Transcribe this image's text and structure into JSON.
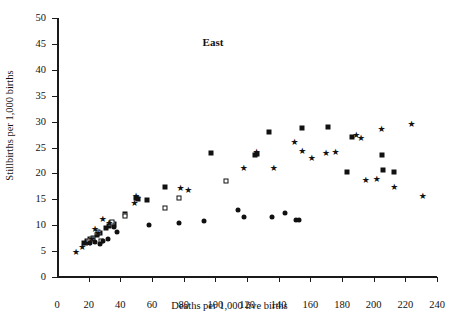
{
  "chart_data": {
    "type": "scatter",
    "title": "East",
    "xlabel": "Deaths per 1,000 live births",
    "ylabel": "Stillbirths per 1,000 births",
    "xlim": [
      0,
      240
    ],
    "ylim": [
      0,
      50
    ],
    "xticks": [
      0,
      20,
      40,
      60,
      80,
      100,
      120,
      140,
      160,
      180,
      200,
      220,
      240
    ],
    "yticks": [
      0,
      5,
      10,
      15,
      20,
      25,
      30,
      35,
      40,
      45,
      50
    ],
    "grid": false,
    "legend": "none",
    "series": [
      {
        "name": "filled-square",
        "marker": "filled-square",
        "points": [
          [
            17,
            6.6
          ],
          [
            19,
            6.9
          ],
          [
            21,
            7.3
          ],
          [
            23,
            7.6
          ],
          [
            25,
            8.1
          ],
          [
            27,
            8.4
          ],
          [
            31,
            9.5
          ],
          [
            33,
            9.8
          ],
          [
            35,
            10.4
          ],
          [
            36,
            10.2
          ],
          [
            43,
            12.2
          ],
          [
            50,
            15.3
          ],
          [
            51,
            15.0
          ],
          [
            57,
            14.8
          ],
          [
            68,
            17.3
          ],
          [
            97,
            23.9
          ],
          [
            125,
            23.5
          ],
          [
            126,
            23.7
          ],
          [
            134,
            27.9
          ],
          [
            155,
            28.7
          ],
          [
            171,
            28.9
          ],
          [
            186,
            27.1
          ],
          [
            183,
            20.2
          ],
          [
            205,
            23.5
          ],
          [
            206,
            20.6
          ],
          [
            213,
            20.2
          ]
        ]
      },
      {
        "name": "open-square",
        "marker": "open-square",
        "points": [
          [
            20,
            7.0
          ],
          [
            22,
            7.3
          ],
          [
            26,
            8.6
          ],
          [
            28,
            7.0
          ],
          [
            34,
            10.5
          ],
          [
            35,
            10.6
          ],
          [
            43,
            11.8
          ],
          [
            68,
            13.3
          ],
          [
            77,
            15.2
          ],
          [
            107,
            18.6
          ]
        ]
      },
      {
        "name": "star",
        "marker": "star",
        "points": [
          [
            12,
            4.9
          ],
          [
            16,
            5.8
          ],
          [
            18,
            6.5
          ],
          [
            20,
            6.6
          ],
          [
            22,
            7.3
          ],
          [
            24,
            9.3
          ],
          [
            26,
            8.5
          ],
          [
            29,
            11.2
          ],
          [
            33,
            10.4
          ],
          [
            49,
            14.2
          ],
          [
            50,
            15.7
          ],
          [
            51,
            15.3
          ],
          [
            78,
            17.1
          ],
          [
            83,
            16.8
          ],
          [
            118,
            21.0
          ],
          [
            126,
            24.2
          ],
          [
            137,
            21.1
          ],
          [
            150,
            26.1
          ],
          [
            155,
            24.4
          ],
          [
            161,
            23.0
          ],
          [
            170,
            24.0
          ],
          [
            176,
            24.2
          ],
          [
            189,
            27.5
          ],
          [
            192,
            26.9
          ],
          [
            195,
            18.7
          ],
          [
            202,
            19.0
          ],
          [
            205,
            28.5
          ],
          [
            213,
            17.4
          ],
          [
            224,
            29.6
          ],
          [
            231,
            15.7
          ]
        ]
      },
      {
        "name": "filled-circle",
        "marker": "filled-circle",
        "points": [
          [
            21,
            6.6
          ],
          [
            24,
            6.8
          ],
          [
            27,
            6.4
          ],
          [
            29,
            6.9
          ],
          [
            32,
            7.4
          ],
          [
            36,
            9.7
          ],
          [
            38,
            8.6
          ],
          [
            58,
            10.0
          ],
          [
            77,
            10.5
          ],
          [
            93,
            10.8
          ],
          [
            114,
            13.0
          ],
          [
            118,
            11.5
          ],
          [
            136,
            11.5
          ],
          [
            144,
            12.3
          ],
          [
            151,
            11.0
          ],
          [
            153,
            11.0
          ]
        ]
      }
    ]
  }
}
